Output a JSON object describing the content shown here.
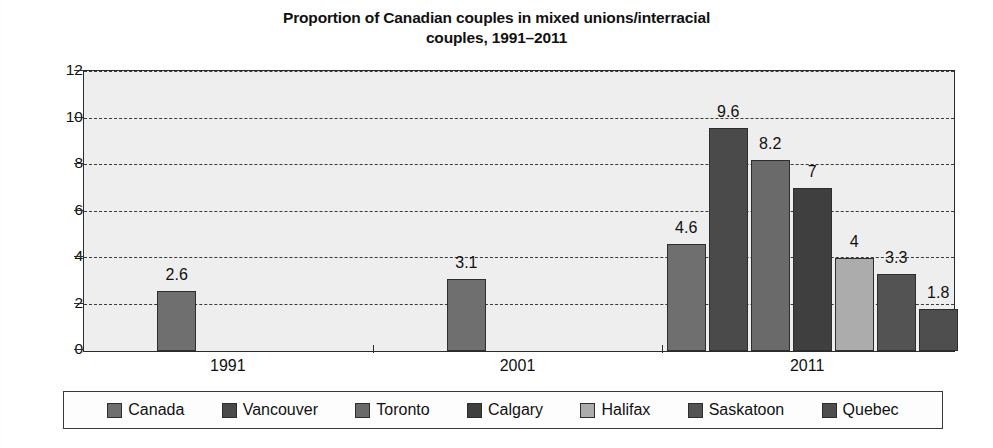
{
  "chart_data": {
    "type": "bar",
    "title": "Proportion of Canadian couples in mixed unions/interracial couples, 1991–2011",
    "title_lines": [
      "Proportion of Canadian couples in mixed unions/interracial",
      "couples, 1991–2011"
    ],
    "xlabel": "",
    "ylabel": "",
    "ylim": [
      0,
      12
    ],
    "yticks": [
      0,
      2,
      4,
      6,
      8,
      10,
      12
    ],
    "ytick_labels": [
      "0",
      "2",
      "4",
      "6",
      "8",
      "10",
      "12"
    ],
    "categories": [
      "1991",
      "2001",
      "2011"
    ],
    "grid": "horizontal-dashed",
    "legend_position": "bottom",
    "series": [
      {
        "name": "Canada",
        "color": "#6f6f6f",
        "values": [
          2.6,
          3.1,
          4.6
        ]
      },
      {
        "name": "Vancouver",
        "color": "#4a4a4a",
        "values": [
          null,
          null,
          9.6
        ]
      },
      {
        "name": "Toronto",
        "color": "#6a6a6a",
        "values": [
          null,
          null,
          8.2
        ]
      },
      {
        "name": "Calgary",
        "color": "#3f3f3f",
        "values": [
          null,
          null,
          7
        ]
      },
      {
        "name": "Halifax",
        "color": "#acacac",
        "values": [
          null,
          null,
          4
        ]
      },
      {
        "name": "Saskatoon",
        "color": "#535353",
        "values": [
          null,
          null,
          3.3
        ]
      },
      {
        "name": "Quebec",
        "color": "#4e4e4e",
        "values": [
          null,
          null,
          1.8
        ]
      }
    ],
    "bars": [
      {
        "group": "1991",
        "series": "Canada",
        "value": 2.6,
        "label": "2.6",
        "color": "#6f6f6f"
      },
      {
        "group": "2001",
        "series": "Canada",
        "value": 3.1,
        "label": "3.1",
        "color": "#6f6f6f"
      },
      {
        "group": "2011",
        "series": "Canada",
        "value": 4.6,
        "label": "4.6",
        "color": "#6f6f6f"
      },
      {
        "group": "2011",
        "series": "Vancouver",
        "value": 9.6,
        "label": "9.6",
        "color": "#4a4a4a"
      },
      {
        "group": "2011",
        "series": "Toronto",
        "value": 8.2,
        "label": "8.2",
        "color": "#6a6a6a"
      },
      {
        "group": "2011",
        "series": "Calgary",
        "value": 7,
        "label": "7",
        "color": "#3f3f3f"
      },
      {
        "group": "2011",
        "series": "Halifax",
        "value": 4,
        "label": "4",
        "color": "#acacac"
      },
      {
        "group": "2011",
        "series": "Saskatoon",
        "value": 3.3,
        "label": "3.3",
        "color": "#535353"
      },
      {
        "group": "2011",
        "series": "Quebec",
        "value": 1.8,
        "label": "1.8",
        "color": "#4e4e4e"
      }
    ]
  },
  "legend": {
    "items": [
      {
        "label": "Canada",
        "color": "#6f6f6f"
      },
      {
        "label": "Vancouver",
        "color": "#4a4a4a"
      },
      {
        "label": "Toronto",
        "color": "#6a6a6a"
      },
      {
        "label": "Calgary",
        "color": "#3f3f3f"
      },
      {
        "label": "Halifax",
        "color": "#acacac"
      },
      {
        "label": "Saskatoon",
        "color": "#535353"
      },
      {
        "label": "Quebec",
        "color": "#4e4e4e"
      }
    ]
  },
  "axes": {
    "y_tick_labels": [
      "12",
      "10",
      "8",
      "6",
      "4",
      "2",
      "0"
    ],
    "x_group_labels": [
      "1991",
      "2001",
      "2011"
    ]
  },
  "colors": {
    "plot_background": "#eeeeee",
    "axis": "#2b2b2b",
    "gridline": "#3a3a3a",
    "text": "#111111",
    "page_background": "#ffffff"
  }
}
